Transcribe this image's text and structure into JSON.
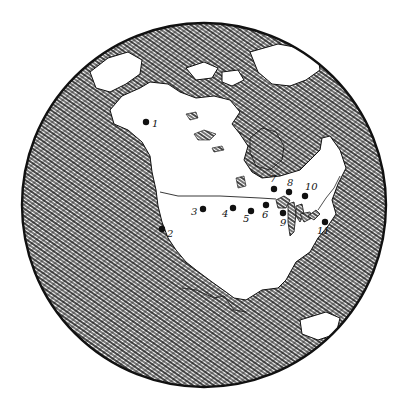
{
  "map": {
    "type": "globe",
    "subject": "North America",
    "style": "hand-drawn pen-and-ink, hatched water, white land",
    "colors": {
      "ink": "#111111",
      "land": "#ffffff",
      "paper": "#ffffff"
    },
    "globe": {
      "cx": 204,
      "cy": 205,
      "r": 182
    },
    "points": [
      {
        "id": "1",
        "label": "1",
        "x": 146,
        "y": 122,
        "lx": 152,
        "ly": 127
      },
      {
        "id": "2",
        "label": "2",
        "x": 162,
        "y": 229,
        "lx": 167,
        "ly": 237
      },
      {
        "id": "3",
        "label": "3",
        "x": 203,
        "y": 209,
        "lx": 191,
        "ly": 215
      },
      {
        "id": "4",
        "label": "4",
        "x": 233,
        "y": 208,
        "lx": 222,
        "ly": 217
      },
      {
        "id": "5",
        "label": "5",
        "x": 251,
        "y": 211,
        "lx": 243,
        "ly": 222
      },
      {
        "id": "6",
        "label": "6",
        "x": 266,
        "y": 205,
        "lx": 262,
        "ly": 218
      },
      {
        "id": "7",
        "label": "7",
        "x": 274,
        "y": 189,
        "lx": 270,
        "ly": 182
      },
      {
        "id": "8",
        "label": "8",
        "x": 289,
        "y": 192,
        "lx": 287,
        "ly": 186
      },
      {
        "id": "9",
        "label": "9",
        "x": 283,
        "y": 213,
        "lx": 280,
        "ly": 226
      },
      {
        "id": "10",
        "label": "10",
        "x": 305,
        "y": 196,
        "lx": 305,
        "ly": 190
      },
      {
        "id": "11",
        "label": "11",
        "x": 325,
        "y": 222,
        "lx": 317,
        "ly": 234
      }
    ]
  }
}
